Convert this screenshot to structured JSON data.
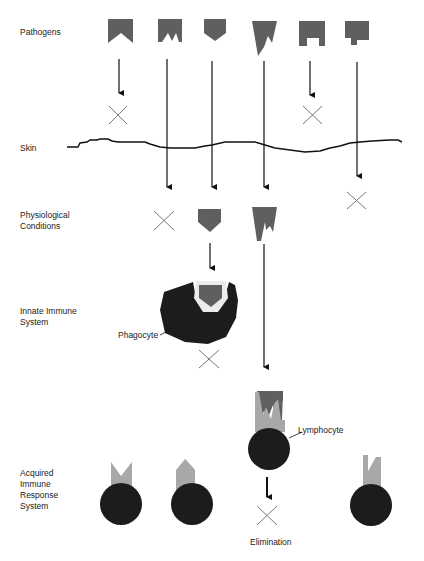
{
  "rows": {
    "pathogens": "Pathogens",
    "skin": "Skin",
    "physiological_line1": "Physiological",
    "physiological_line2": "Conditions",
    "innate_line1": "Innate Immune",
    "innate_line2": "System",
    "acquired_line1": "Acquired",
    "acquired_line2": "Immune",
    "acquired_line3": "Response",
    "acquired_line4": "System"
  },
  "annotations": {
    "phagocyte": "Phagocyte",
    "lymphocyte": "Lymphocyte",
    "elimination": "Elimination"
  },
  "pathogens": [
    {
      "id": 1,
      "shape": "notched-v",
      "blocked_at": "skin"
    },
    {
      "id": 2,
      "shape": "double-notch",
      "blocked_at": "physiological-conditions"
    },
    {
      "id": 3,
      "shape": "pentagon-point",
      "blocked_at": "innate-immune-system"
    },
    {
      "id": 4,
      "shape": "fangs",
      "blocked_at": "acquired-immune-response"
    },
    {
      "id": 5,
      "shape": "arch",
      "blocked_at": "skin"
    },
    {
      "id": 6,
      "shape": "step",
      "blocked_at": "skin-crossed-then-blocked"
    }
  ],
  "colors": {
    "pathogen": "#5f5f5f",
    "receptor": "#a8a8a8",
    "cell": "#1c1c1c",
    "line": "#111111",
    "cross": "#777777"
  }
}
